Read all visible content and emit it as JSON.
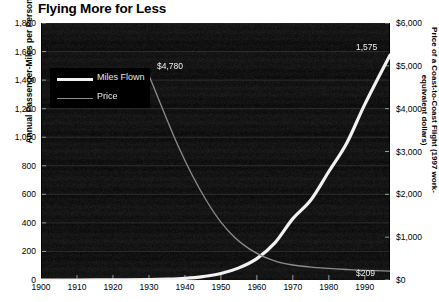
{
  "chart_data": {
    "type": "line",
    "title": "Flying More for Less",
    "xlabel": "",
    "ylabel": "Annual Passenger-Miles per Person",
    "y2label": "Price of a Coast-to-Coast Flight (1997 work-equivalent dollars)",
    "xlim": [
      1900,
      1997
    ],
    "ylim": [
      0,
      1800
    ],
    "y2lim": [
      0,
      6000
    ],
    "grid": true,
    "legend_position": "upper-left",
    "plot_background": "#0d0d0d",
    "xticks": [
      1900,
      1910,
      1920,
      1930,
      1940,
      1950,
      1960,
      1970,
      1980,
      1990
    ],
    "xtick_labels": [
      "1900",
      "1910",
      "1920",
      "1930",
      "1940",
      "1950",
      "1960",
      "1970",
      "1980",
      "1990"
    ],
    "yticks": [
      0,
      200,
      400,
      600,
      800,
      1000,
      1200,
      1400,
      1600,
      1800
    ],
    "ytick_labels": [
      "0",
      "200",
      "400",
      "600",
      "800",
      "1,000",
      "1,200",
      "1,400",
      "1,600",
      "1,800"
    ],
    "y2ticks": [
      0,
      1000,
      2000,
      3000,
      4000,
      5000,
      6000
    ],
    "y2tick_labels": [
      "$0",
      "$1,000",
      "$2,000",
      "$3,000",
      "$4,000",
      "$5,000",
      "$6,000"
    ],
    "series": [
      {
        "name": "Miles Flown",
        "axis": "left",
        "color": "#f2f2f2",
        "width": 3.2,
        "x": [
          1900,
          1910,
          1920,
          1930,
          1935,
          1940,
          1945,
          1950,
          1955,
          1960,
          1965,
          1970,
          1975,
          1980,
          1985,
          1990,
          1997
        ],
        "values": [
          0,
          0,
          1,
          3,
          6,
          12,
          24,
          45,
          85,
          150,
          260,
          430,
          560,
          760,
          960,
          1230,
          1575
        ]
      },
      {
        "name": "Price",
        "axis": "right",
        "color": "#8d8d8d",
        "width": 1.3,
        "x": [
          1930,
          1934,
          1938,
          1942,
          1946,
          1950,
          1954,
          1958,
          1962,
          1966,
          1970,
          1975,
          1980,
          1985,
          1990,
          1997
        ],
        "values": [
          4780,
          3950,
          3150,
          2450,
          1850,
          1350,
          980,
          720,
          540,
          420,
          350,
          300,
          270,
          245,
          225,
          209
        ]
      }
    ],
    "annotations": [
      {
        "text": "$4,780",
        "x": 1930,
        "series": "Price",
        "name": "price-start-label"
      },
      {
        "text": "1,575",
        "x": 1997,
        "series": "Miles Flown",
        "name": "miles-end-label"
      },
      {
        "text": "$209",
        "x": 1997,
        "series": "Price",
        "name": "price-end-label"
      }
    ]
  },
  "legend": {
    "items": [
      {
        "label": "Miles Flown",
        "style": "thick-white-line"
      },
      {
        "label": "Price",
        "style": "thin-gray-line"
      }
    ]
  }
}
